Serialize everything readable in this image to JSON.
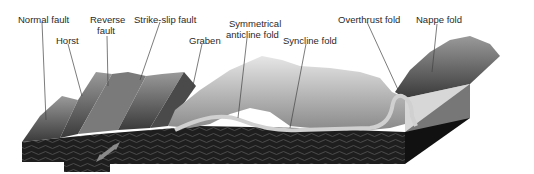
{
  "diagram": {
    "labels": [
      {
        "id": "normal-fault",
        "text": "Normal fault"
      },
      {
        "id": "horst",
        "text": "Horst"
      },
      {
        "id": "reverse-fault-1",
        "text": "Reverse"
      },
      {
        "id": "reverse-fault-2",
        "text": "fault"
      },
      {
        "id": "strike-slip-fault",
        "text": "Strike-slip fault"
      },
      {
        "id": "graben",
        "text": "Graben"
      },
      {
        "id": "anticline-1",
        "text": "Symmetrical"
      },
      {
        "id": "anticline-2",
        "text": "anticline fold"
      },
      {
        "id": "syncline-fold",
        "text": "Syncline fold"
      },
      {
        "id": "overthrust-fold",
        "text": "Overthrust fold"
      },
      {
        "id": "nappe-fold",
        "text": "Nappe fold"
      }
    ],
    "colors": {
      "rock_dark": "#1c1c1c",
      "rock_mid": "#555555",
      "terrain_light": "#d8d8d8",
      "arrow": "#8a8a8a",
      "leader_line": "#444444"
    }
  }
}
